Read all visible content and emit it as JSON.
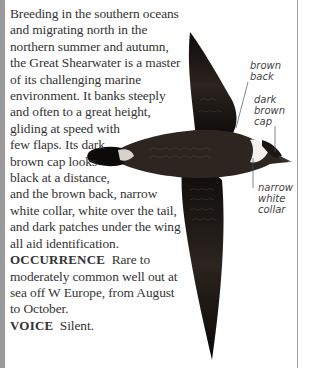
{
  "description": {
    "lines": [
      "Breeding in the southern oceans",
      "and migrating north in the",
      "northern summer and autumn,",
      "the Great Shearwater is a master",
      "of its challenging marine",
      "environment. It banks steeply",
      "and often to a great height,",
      "gliding at speed with",
      "few flaps. Its dark",
      "brown cap looks",
      "black at a distance,",
      "and the brown back, narrow",
      "white collar, white over the tail,",
      "and dark patches under the wing",
      "all aid identification."
    ]
  },
  "occurrence": {
    "heading": "OCCURRENCE",
    "lines": [
      "Rare to",
      "moderately common well out at",
      "sea off W Europe, from August",
      "to October."
    ]
  },
  "voice": {
    "heading": "VOICE",
    "text": "Silent."
  },
  "labels": {
    "brown_back": [
      "brown",
      "back"
    ],
    "dark_brown_cap": [
      "dark",
      "brown",
      "cap"
    ],
    "narrow_white_collar": [
      "narrow",
      "white",
      "collar"
    ]
  },
  "colors": {
    "text": "#333333",
    "bird_dark": "#1a1614",
    "bird_mid": "#4a3f38",
    "left_bar": "#9a9a9a"
  }
}
